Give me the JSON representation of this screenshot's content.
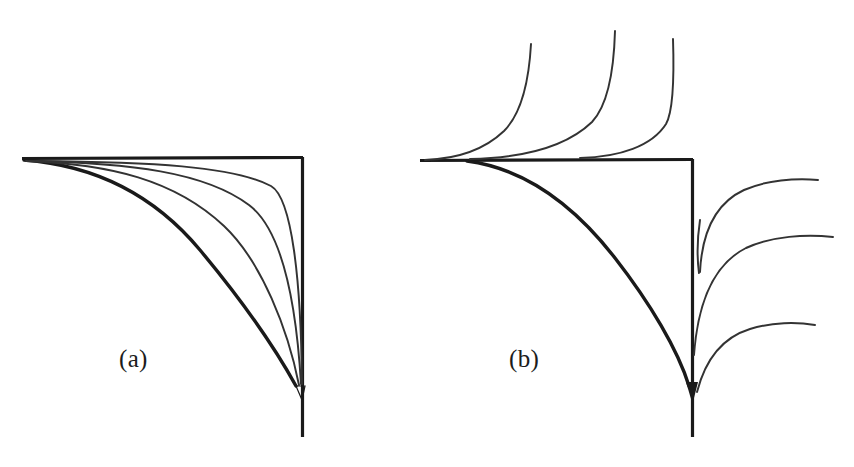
{
  "figure": {
    "background_color": "#ffffff",
    "ink_color": "#1a1a1a",
    "width": 854,
    "height": 467,
    "panels": [
      {
        "id": "a",
        "label": "(a)",
        "label_x": 119,
        "label_y": 346,
        "description": "Single family of hyperbola-like curves filling the region inside a right-angle corner formed by a horizontal ray and a vertical ray; all curves converge to a common point on the vertical axis below the corner.",
        "axes": {
          "corner_x": 302,
          "corner_y": 158,
          "horizontal_start_x": 22,
          "horizontal_end_x": 302,
          "horizontal_y": 158,
          "vertical_x": 302,
          "vertical_start_y": 158,
          "vertical_end_y": 437,
          "axis_stroke_width": 3.2
        },
        "convergence_point": {
          "x": 302,
          "y": 385
        },
        "curve_count": 4,
        "curves": [
          {
            "name": "curve-a-1",
            "bend": 0.96,
            "stroke_width": 3.4,
            "weight": "heavy"
          },
          {
            "name": "curve-a-2",
            "bend": 0.7,
            "stroke_width": 1.9,
            "weight": "light"
          },
          {
            "name": "curve-a-3",
            "bend": 0.48,
            "stroke_width": 1.9,
            "weight": "light"
          },
          {
            "name": "curve-a-4",
            "bend": 0.26,
            "stroke_width": 1.9,
            "weight": "light"
          }
        ]
      },
      {
        "id": "b",
        "label": "(b)",
        "label_x": 509,
        "label_y": 346,
        "description": "Saddle-type configuration: separatrix axes meet at a corner; one heavy hyperbolic arc runs from a node on the horizontal axis down to a focus on the vertical axis; three curves rise steeply above the horizontal axis on the left and three curves sweep out to the right of the vertical axis.",
        "axes": {
          "corner_x": 692,
          "corner_y": 160,
          "horizontal_start_x": 420,
          "horizontal_end_x": 692,
          "horizontal_y": 160,
          "vertical_x": 692,
          "vertical_start_y": 160,
          "vertical_end_y": 437,
          "axis_stroke_width": 3.2
        },
        "node_point": {
          "x": 467,
          "y": 160
        },
        "convergence_point": {
          "x": 692,
          "y": 385
        },
        "separatrix": {
          "name": "separatrix-heavy",
          "stroke_width": 3.4,
          "from": {
            "x": 467,
            "y": 160
          },
          "to": {
            "x": 692,
            "y": 385
          }
        },
        "upper_curves": [
          {
            "name": "upper-curve-1",
            "top_x": 531,
            "top_y": 44,
            "stroke_width": 1.9
          },
          {
            "name": "upper-curve-2",
            "top_x": 615,
            "top_y": 31,
            "stroke_width": 1.9
          },
          {
            "name": "upper-curve-3",
            "top_x": 673,
            "top_y": 39,
            "stroke_width": 1.9
          }
        ],
        "right_curves": [
          {
            "name": "right-curve-1",
            "end_x": 818,
            "end_y": 180,
            "stroke_width": 1.9
          },
          {
            "name": "right-curve-2",
            "end_x": 833,
            "end_y": 237,
            "stroke_width": 1.9
          },
          {
            "name": "right-curve-3",
            "end_x": 815,
            "end_y": 325,
            "stroke_width": 1.9
          }
        ],
        "short_stub": {
          "name": "inner-stub",
          "x": 700,
          "top_y": 220,
          "bottom_y": 273,
          "stroke_width": 1.9
        }
      }
    ]
  }
}
